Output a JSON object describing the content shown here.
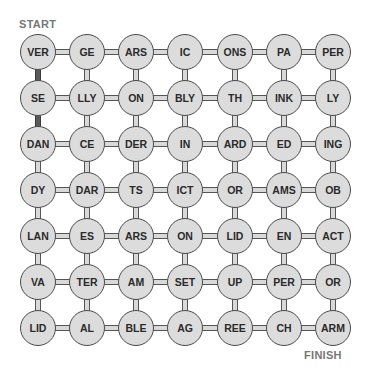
{
  "labels": {
    "start": "START",
    "finish": "FINISH"
  },
  "colors": {
    "node_fill": "#dcdcdc",
    "node_border": "#4a4a4a",
    "tube_fill": "#d9d9d9",
    "path_fill": "#5a5a5a",
    "label": "#777777"
  },
  "grid": {
    "rows": 7,
    "cols": 7,
    "cells": [
      [
        "VER",
        "GE",
        "ARS",
        "IC",
        "ONS",
        "PA",
        "PER"
      ],
      [
        "SE",
        "LLY",
        "ON",
        "BLY",
        "TH",
        "INK",
        "LY"
      ],
      [
        "DAN",
        "CE",
        "DER",
        "IN",
        "ARD",
        "ED",
        "ING"
      ],
      [
        "DY",
        "DAR",
        "TS",
        "ICT",
        "OR",
        "AMS",
        "OB"
      ],
      [
        "LAN",
        "ES",
        "ARS",
        "ON",
        "LID",
        "EN",
        "ACT"
      ],
      [
        "VA",
        "TER",
        "AM",
        "SET",
        "UP",
        "PER",
        "OR"
      ],
      [
        "LID",
        "AL",
        "BLE",
        "AG",
        "REE",
        "CH",
        "ARM"
      ]
    ],
    "highlighted_path": [
      [
        0,
        0
      ],
      [
        1,
        0
      ],
      [
        2,
        0
      ]
    ]
  }
}
